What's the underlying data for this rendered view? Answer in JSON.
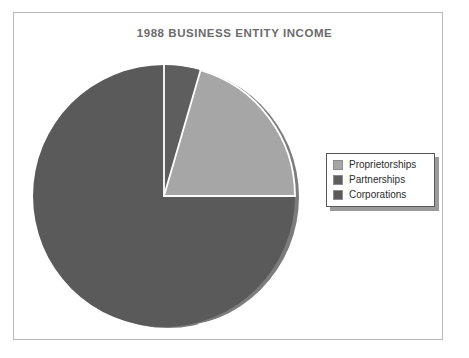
{
  "figure": {
    "background_color": "#ffffff",
    "frame_color": "#b9b9b9"
  },
  "title": "1988 BUSINESS ENTITY INCOME",
  "legend": {
    "position": "right",
    "border_color": "#585858",
    "shadow_color": "#9b9b9b",
    "items": [
      {
        "label": "Proprietorships",
        "color": "#a6a6a6"
      },
      {
        "label": "Partnerships",
        "color": "#5e5e5e"
      },
      {
        "label": "Corporations",
        "color": "#5a5a5a"
      }
    ]
  },
  "chart_data": {
    "type": "pie",
    "title": "1988 BUSINESS ENTITY INCOME",
    "xlabel": "",
    "ylabel": "",
    "labels": [
      "Proprietorships",
      "Partnerships",
      "Corporations"
    ],
    "values": [
      20.5,
      4.5,
      75.0
    ],
    "colors": [
      "#a6a6a6",
      "#5e5e5e",
      "#5a5a5a"
    ],
    "units": "percent",
    "start_angle_deg": 90,
    "direction": "clockwise",
    "slice_order_from_12_oclock_clockwise": [
      "Partnerships",
      "Proprietorships",
      "Corporations"
    ],
    "separator_color": "#ffffff",
    "has_depth_shadow": true,
    "legend_position": "right",
    "grid": false,
    "data_labels_shown": false
  },
  "geometry": {
    "pie_center_x": 164,
    "pie_center_y": 196,
    "pie_radius": 131
  }
}
